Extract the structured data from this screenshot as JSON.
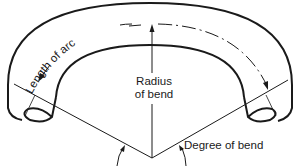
{
  "diagram": {
    "labels": {
      "length_of_arc": "Length of arc",
      "radius_line1": "Radius",
      "radius_line2": "of bend",
      "degree_of_bend": "Degree of bend"
    },
    "colors": {
      "stroke": "#1a1a1a",
      "background": "#ffffff"
    }
  }
}
